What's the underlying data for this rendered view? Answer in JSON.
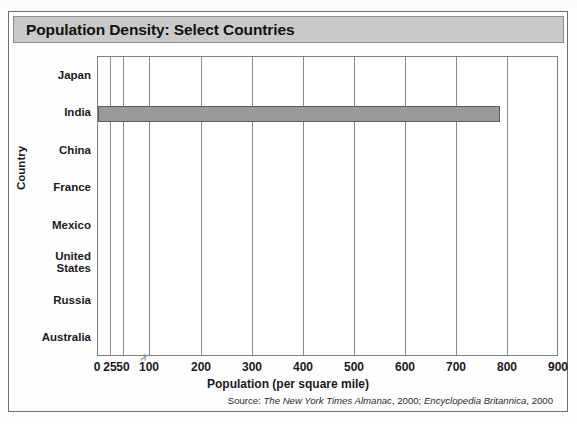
{
  "figure": {
    "title": "Population Density: Select Countries",
    "source_prefix": "Source: ",
    "source_italic_1": "The New York Times Almanac",
    "source_mid": ", 2000; ",
    "source_italic_2": "Encyclopedia Britannica",
    "source_suffix": ", 2000",
    "title_bar_color": "#c9c9c9",
    "bar_color": "#9a9a9a",
    "bar_border_color": "#5d5d5d",
    "grid_color": "#8a8a8a",
    "artifact_glyph": "✗"
  },
  "chart_data": {
    "type": "bar",
    "orientation": "horizontal",
    "title": "Population Density: Select Countries",
    "xlabel": "Population (per square mile)",
    "ylabel": "Country",
    "categories": [
      "Japan",
      "India",
      "China",
      "France",
      "Mexico",
      "United States",
      "Russia",
      "Australia"
    ],
    "values": [
      null,
      785,
      null,
      null,
      null,
      null,
      null,
      null
    ],
    "series": [
      {
        "name": "Population density",
        "values": [
          null,
          785,
          null,
          null,
          null,
          null,
          null,
          null
        ]
      }
    ],
    "xlim": [
      0,
      900
    ],
    "xticks": [
      0,
      25,
      50,
      100,
      200,
      300,
      400,
      500,
      600,
      700,
      800,
      900
    ],
    "xticklabels": [
      "0",
      "25",
      "50",
      "100",
      "200",
      "300",
      "400",
      "500",
      "600",
      "700",
      "800",
      "900"
    ],
    "x_scale_note": "non-uniform: 0, 25, 50 compressed before 100",
    "grid": "vertical",
    "legend": "none",
    "bars_drawn": [
      "India"
    ]
  }
}
